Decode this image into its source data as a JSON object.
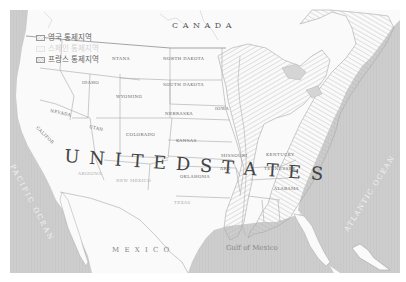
{
  "legend": {
    "items": [
      {
        "label": "영국 통제지역",
        "pattern": "hatched-diagonal"
      },
      {
        "label": "스페인 통제지역",
        "pattern": "plain-light"
      },
      {
        "label": "프랑스 통제지역",
        "pattern": "hatched-diagonal"
      }
    ]
  },
  "labels": {
    "canada": "C A N A D A",
    "united_states": "U N I T E D   S T A T E S",
    "mexico": "M E X I C O",
    "gulf": "Gulf of Mexico",
    "pacific": "PACIFIC OCEAN",
    "atlantic": "ATLANTIC OCEAN",
    "states": {
      "montana": "NTANA",
      "north_dakota": "NORTH DAKOTA",
      "south_dakota": "SOUTH DAKOTA",
      "idaho": "IDAHO",
      "wyoming": "WYOMING",
      "nevada": "NEVADA",
      "utah": "UTAH",
      "colorado": "COLORADO",
      "nebraska": "NEBRASKA",
      "kansas": "KANSAS",
      "iowa": "IOWA",
      "missouri": "MISSOURI",
      "oklahoma": "OKLAHOMA",
      "kentucky": "KENTUCKY",
      "tennessee": "TENNESSEE",
      "alabama": "ALABAMA",
      "california": "CALIFOR",
      "arizona": "ARIZONA",
      "new_mexico": "NEW MEXICO",
      "texas": "TEXAS",
      "arkansas": "ARK"
    }
  },
  "colors": {
    "ocean": "#cfcfcf",
    "land": "#fafafa",
    "border": "#a8a8a8",
    "hatch": "#bdbdbd",
    "label": "#555555"
  }
}
